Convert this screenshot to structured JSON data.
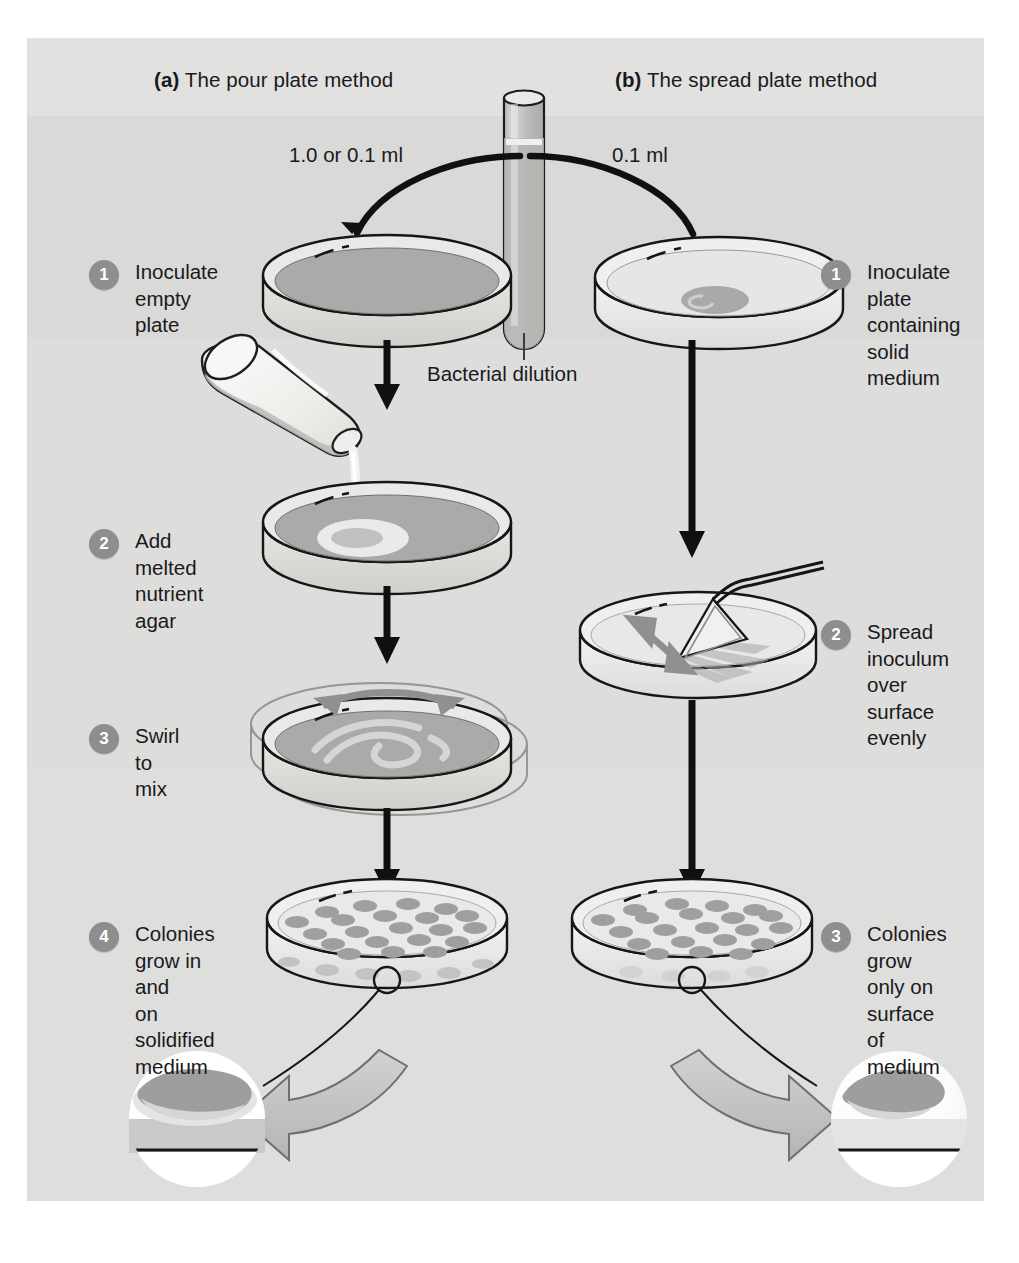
{
  "figure": {
    "background_color": "#dededd",
    "panels": [
      {
        "key": "a",
        "tag": "(a)",
        "title": "The pour plate method",
        "volume_label": "1.0 or 0.1 ml"
      },
      {
        "key": "b",
        "tag": "(b)",
        "title": "The spread plate method",
        "volume_label": "0.1 ml"
      }
    ],
    "center_label": "Bacterial dilution",
    "accent_colors": {
      "step_badge": "#8d8d8d",
      "medium_dark": "#a9a9a8",
      "medium_light": "#e8e8e6",
      "colony": "#9b9b9a",
      "arrow_gray": "#8f8f8e",
      "outline": "#141414"
    },
    "left_steps": [
      {
        "num": "1",
        "text": "Inoculate\nempty plate"
      },
      {
        "num": "2",
        "text": "Add melted\nnutrient agar"
      },
      {
        "num": "3",
        "text": "Swirl to mix"
      },
      {
        "num": "4",
        "text": "Colonies\ngrow in and\non solidified\nmedium"
      }
    ],
    "right_steps": [
      {
        "num": "1",
        "text": "Inoculate plate\ncontaining\nsolid medium"
      },
      {
        "num": "2",
        "text": "Spread inoculum\nover surface\nevenly"
      },
      {
        "num": "3",
        "text": "Colonies grow\nonly on surface\nof medium"
      }
    ],
    "insets": [
      {
        "key": "pour-inset",
        "description": "Colony embedded within solidified medium"
      },
      {
        "key": "spread-inset",
        "description": "Colony resting on surface of medium"
      }
    ]
  }
}
